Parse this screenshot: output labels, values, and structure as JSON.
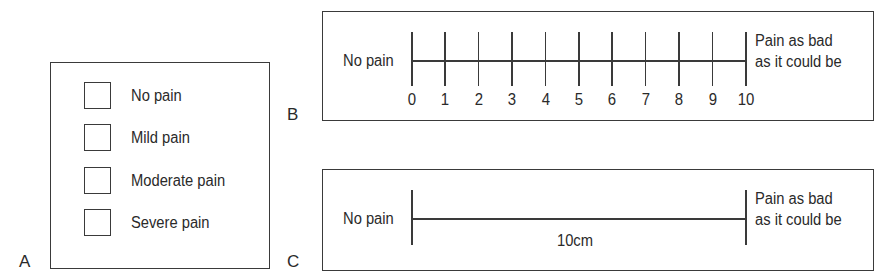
{
  "panels": {
    "a": {
      "letter": "A",
      "title": "Verbal rating scale",
      "options": [
        {
          "label": "No pain",
          "checked": false
        },
        {
          "label": "Mild pain",
          "checked": false
        },
        {
          "label": "Moderate pain",
          "checked": false
        },
        {
          "label": "Severe pain",
          "checked": false
        }
      ]
    },
    "b": {
      "letter": "B",
      "left_anchor": "No pain",
      "right_anchor_line1": "Pain as bad",
      "right_anchor_line2": "as it could be",
      "ticks": [
        "0",
        "1",
        "2",
        "3",
        "4",
        "5",
        "6",
        "7",
        "8",
        "9",
        "10"
      ]
    },
    "c": {
      "letter": "C",
      "left_anchor": "No pain",
      "right_anchor_line1": "Pain as bad",
      "right_anchor_line2": "as it could be",
      "length_label": "10cm"
    }
  },
  "colors": {
    "line": "#3a3a3a",
    "text": "#2a2a2a",
    "background": "#ffffff"
  }
}
